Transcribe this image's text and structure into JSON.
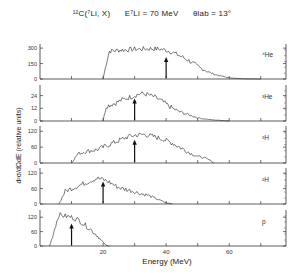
{
  "title": {
    "reaction": "¹²C(⁷Li, X)",
    "energy": "E⁷Li = 70 MeV",
    "angle": "θlab = 13°"
  },
  "chart_data": {
    "type": "line",
    "xlabel": "Energy (MeV)",
    "ylabel": "d²σ/dΩdE (relative units)",
    "xlim": [
      0,
      78
    ],
    "x_ticks": [
      20,
      40,
      60
    ],
    "grid": false,
    "legend_position": "panel labels right",
    "panels": [
      {
        "label": "⁴He",
        "y_ticks": [
          0,
          150,
          300
        ],
        "ylim": [
          0,
          340
        ],
        "arrow_x": 40,
        "x": [
          20,
          21,
          22,
          25,
          28,
          30,
          32,
          35,
          38,
          40,
          42,
          44,
          46,
          48,
          50,
          52,
          54,
          56,
          58,
          60,
          62,
          65,
          70
        ],
        "y": [
          0,
          150,
          270,
          280,
          285,
          290,
          290,
          295,
          290,
          280,
          260,
          230,
          200,
          165,
          120,
          90,
          60,
          40,
          25,
          12,
          6,
          2,
          0
        ]
      },
      {
        "label": "³He",
        "y_ticks": [
          0,
          12,
          24
        ],
        "ylim": [
          0,
          34
        ],
        "arrow_x": 30,
        "x": [
          20,
          21,
          24,
          26,
          28,
          30,
          32,
          34,
          36,
          38,
          40,
          42,
          44,
          46,
          48,
          50,
          52,
          55,
          60
        ],
        "y": [
          0,
          14,
          17,
          20,
          22,
          24,
          26,
          25,
          23,
          20,
          16,
          12,
          9,
          7,
          5,
          3,
          2,
          1,
          0
        ]
      },
      {
        "label": "³H",
        "y_ticks": [
          0,
          60,
          120
        ],
        "ylim": [
          0,
          140
        ],
        "arrow_x": 30,
        "x": [
          10,
          12,
          15,
          18,
          20,
          23,
          26,
          28,
          30,
          33,
          36,
          39,
          42,
          45,
          48,
          50,
          52,
          54,
          55
        ],
        "y": [
          0,
          35,
          45,
          50,
          60,
          75,
          90,
          100,
          105,
          108,
          100,
          90,
          75,
          55,
          35,
          25,
          20,
          10,
          0
        ]
      },
      {
        "label": "²H",
        "y_ticks": [
          0,
          60,
          120
        ],
        "ylim": [
          0,
          140
        ],
        "arrow_x": 20,
        "x": [
          6,
          7,
          8,
          10,
          12,
          14,
          16,
          18,
          20,
          22,
          24,
          26,
          28,
          30,
          32,
          34,
          36,
          38,
          40,
          42
        ],
        "y": [
          0,
          25,
          50,
          60,
          70,
          80,
          90,
          100,
          95,
          85,
          70,
          60,
          55,
          48,
          40,
          35,
          25,
          15,
          5,
          0
        ]
      },
      {
        "label": "p",
        "y_ticks": [
          0,
          60,
          120
        ],
        "ylim": [
          0,
          150
        ],
        "arrow_x": 10,
        "x": [
          3,
          4,
          5,
          6,
          8,
          10,
          12,
          14,
          16,
          18,
          19,
          20,
          21,
          22
        ],
        "y": [
          0,
          40,
          90,
          130,
          125,
          120,
          110,
          90,
          70,
          45,
          30,
          15,
          3,
          0
        ]
      }
    ]
  },
  "axes": {
    "xlabel": "Energy (MeV)",
    "ylabel": "d²σ/dΩdE (relative units)",
    "x_tick_labels": [
      "20",
      "40",
      "60"
    ]
  }
}
